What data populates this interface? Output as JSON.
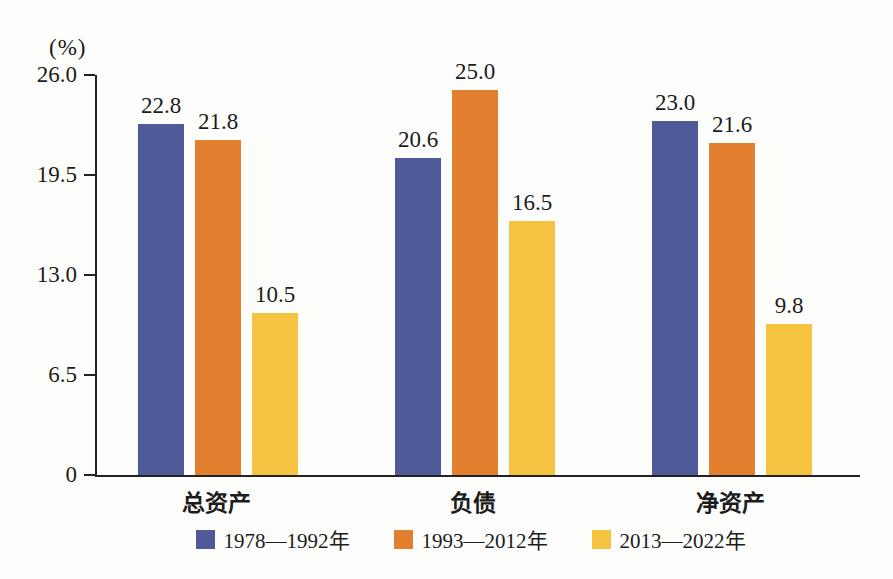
{
  "figure": {
    "background": "#fdfdfb",
    "axis_color": "#222222",
    "text_color": "#1c1c1c"
  },
  "chart_data": {
    "type": "bar",
    "title": "",
    "xlabel": "",
    "ylabel": "(%)",
    "categories": [
      "总资产",
      "负债",
      "净资产"
    ],
    "series": [
      {
        "name": "1978—1992年",
        "color": "#4F5B99",
        "values": [
          22.8,
          20.6,
          23.0
        ]
      },
      {
        "name": "1993—2012年",
        "color": "#E2802F",
        "values": [
          21.8,
          25.0,
          21.6
        ]
      },
      {
        "name": "2013—2022年",
        "color": "#F5C33F",
        "values": [
          10.5,
          16.5,
          9.8
        ]
      }
    ],
    "value_labels_shown": true,
    "y_ticks": [
      0,
      6.5,
      13.0,
      19.5,
      26.0
    ],
    "y_tick_labels": [
      "0",
      "6.5",
      "13.0",
      "19.5",
      "26.0"
    ],
    "ylim": [
      0,
      26
    ],
    "grid": false,
    "legend_position": "bottom"
  }
}
